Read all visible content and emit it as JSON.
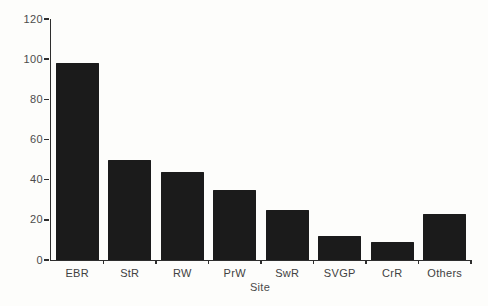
{
  "figure": {
    "background_color": "#fdfdfb"
  },
  "chart_data": {
    "type": "bar",
    "categories": [
      "EBR",
      "StR",
      "RW",
      "PrW",
      "SwR",
      "SVGP",
      "CrR",
      "Others"
    ],
    "values": [
      98,
      50,
      44,
      35,
      25,
      12,
      9,
      23
    ],
    "title": "",
    "xlabel": "Site",
    "ylabel": "Number of birds",
    "ylim": [
      0,
      120
    ],
    "yticks": [
      0,
      20,
      40,
      60,
      80,
      100,
      120
    ],
    "grid": false,
    "legend": "none",
    "bar_color": "#1b1b1b",
    "axis_color": "#2e2e2e",
    "text_color": "#4a4a4a"
  }
}
